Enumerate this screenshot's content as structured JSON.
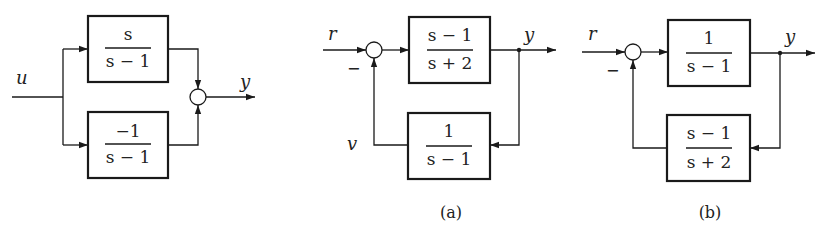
{
  "diagrams": {
    "parallel": {
      "input_label": "u",
      "output_label": "y",
      "top_block": {
        "numerator": "s",
        "denominator": "s − 1"
      },
      "bottom_block": {
        "numerator": "−1",
        "denominator": "s − 1"
      }
    },
    "a": {
      "caption": "(a)",
      "input_label": "r",
      "output_label": "y",
      "feedback_label": "v",
      "feedback_sign": "−",
      "forward_block": {
        "numerator": "s − 1",
        "denominator": "s + 2"
      },
      "feedback_block": {
        "numerator": "1",
        "denominator": "s − 1"
      }
    },
    "b": {
      "caption": "(b)",
      "input_label": "r",
      "output_label": "y",
      "feedback_sign": "−",
      "forward_block": {
        "numerator": "1",
        "denominator": "s − 1"
      },
      "feedback_block": {
        "numerator": "s − 1",
        "denominator": "s + 2"
      }
    }
  }
}
